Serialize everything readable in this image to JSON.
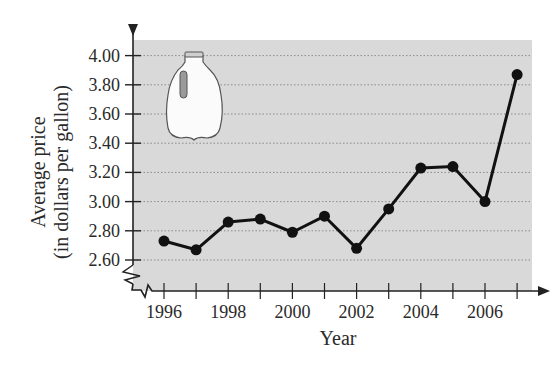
{
  "chart_data": {
    "type": "line",
    "title": "",
    "xlabel": "Year",
    "ylabel": "Average price (in dollars per gallon)",
    "ylabel_lines": [
      "Average price",
      "(in dollars per gallon)"
    ],
    "x": [
      1996,
      1997,
      1998,
      1999,
      2000,
      2001,
      2002,
      2003,
      2004,
      2005,
      2006,
      2007
    ],
    "series": [
      {
        "name": "Average price of milk",
        "values": [
          2.73,
          2.67,
          2.86,
          2.88,
          2.79,
          2.9,
          2.68,
          2.95,
          3.23,
          3.24,
          3.0,
          3.87
        ]
      }
    ],
    "xticks": [
      1996,
      1997,
      1998,
      1999,
      2000,
      2001,
      2002,
      2003,
      2004,
      2005,
      2006,
      2007
    ],
    "xtick_labels": [
      "1996",
      "1998",
      "2000",
      "2002",
      "2004",
      "2006"
    ],
    "yticks": [
      2.6,
      2.8,
      3.0,
      3.2,
      3.4,
      3.6,
      3.8,
      4.0
    ],
    "ytick_labels": [
      "2.60",
      "2.80",
      "3.00",
      "3.20",
      "3.40",
      "3.60",
      "3.80",
      "4.00"
    ],
    "ylim": [
      2.6,
      4.0
    ],
    "y_axis_break": true,
    "grid": "horizontal dotted",
    "legend": "none",
    "decoration": "milk-jug illustration in upper left of plot area",
    "colors": {
      "plot_background": "#d9d9d9",
      "line": "#111111",
      "grid": "#8a8a8a"
    }
  }
}
